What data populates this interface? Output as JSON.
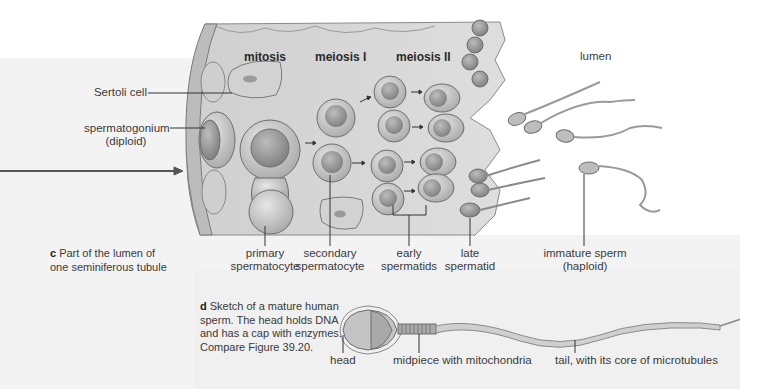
{
  "figure_c": {
    "letter": "c",
    "caption_line1": "Part of the lumen of",
    "caption_line2": "one seminiferous tubule",
    "stages": {
      "mitosis": "mitosis",
      "meiosis1": "meiosis I",
      "meiosis2": "meiosis II"
    },
    "lumen_label": "lumen",
    "labels": {
      "sertoli": "Sertoli cell",
      "spermatogonium_line1": "spermatogonium",
      "spermatogonium_line2": "(diploid)",
      "primary_line1": "primary",
      "primary_line2": "spermatocyte",
      "secondary_line1": "secondary",
      "secondary_line2": "spermatocyte",
      "early_line1": "early",
      "early_line2": "spermatids",
      "late_line1": "late",
      "late_line2": "spermatid",
      "immature_line1": "immature sperm",
      "immature_line2": "(haploid)"
    }
  },
  "figure_d": {
    "letter": "d",
    "caption_line1": "Sketch of a mature human",
    "caption_line2": "sperm. The head holds DNA",
    "caption_line3": "and has a cap with enzymes.",
    "caption_line4": "Compare Figure 39.20.",
    "labels": {
      "head": "head",
      "midpiece": "midpiece with mitochondria",
      "tail": "tail, with its core of microtubules"
    }
  },
  "colors": {
    "cell_fill": "#c9c9c9",
    "tissue_fill": "#d8d8d8",
    "outline": "#6e6e6e"
  }
}
